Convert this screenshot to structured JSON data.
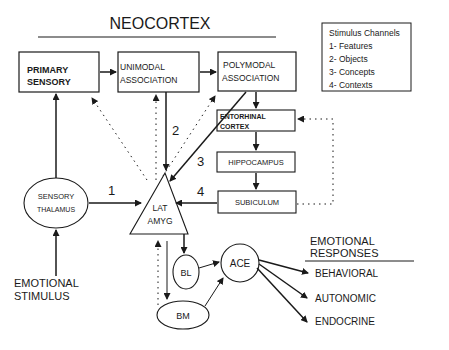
{
  "title": "NEOCORTEX",
  "legend": {
    "heading": "Stimulus Channels",
    "items": [
      "1- Features",
      "2- Objects",
      "3- Concepts",
      "4- Contexts"
    ]
  },
  "nodes": {
    "primary_sensory": [
      "PRIMARY",
      "SENSORY"
    ],
    "unimodal": [
      "UNIMODAL",
      "ASSOCIATION"
    ],
    "polymodal": [
      "POLYMODAL",
      "ASSOCIATION"
    ],
    "entorhinal": [
      "ENTORHINAL",
      "CORTEX"
    ],
    "hippocampus": "HIPPOCAMPUS",
    "subiculum": "SUBICULUM",
    "sensory_thalamus": [
      "SENSORY",
      "THALAMUS"
    ],
    "lat_amyg": [
      "LAT",
      "AMYG"
    ],
    "bl": "BL",
    "bm": "BM",
    "ace": "ACE"
  },
  "channel_labels": [
    "1",
    "2",
    "3",
    "4"
  ],
  "input": [
    "EMOTIONAL",
    "STIMULUS"
  ],
  "responses": {
    "heading": [
      "EMOTIONAL",
      "RESPONSES"
    ],
    "items": [
      "BEHAVIORAL",
      "AUTONOMIC",
      "ENDOCRINE"
    ]
  }
}
